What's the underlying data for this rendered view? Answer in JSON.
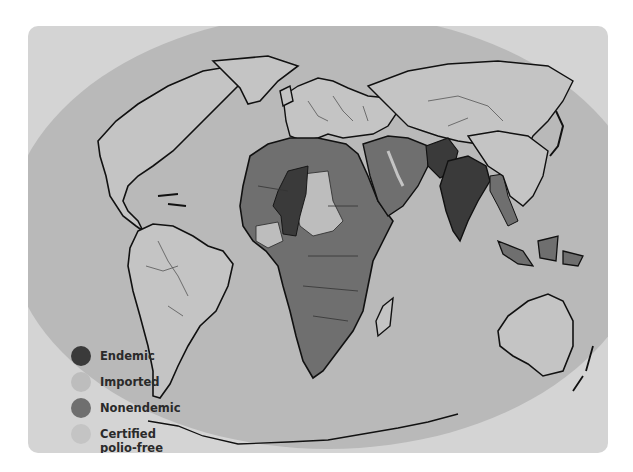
{
  "map": {
    "title": "Polio status world map",
    "colors": {
      "panel_background": "#d4d4d4",
      "globe_ocean": "#b9b9b9",
      "endemic": "#3a3a3a",
      "imported": "#bdbdbd",
      "nonendemic": "#6f6f6f",
      "certified_polio_free": "#c4c4c4",
      "coastline": "#111111",
      "border": "#444444"
    },
    "regions": [
      {
        "name": "Nigeria",
        "status": "Endemic"
      },
      {
        "name": "Niger",
        "status": "Endemic"
      },
      {
        "name": "India",
        "status": "Endemic"
      },
      {
        "name": "Pakistan",
        "status": "Endemic"
      },
      {
        "name": "Afghanistan",
        "status": "Endemic"
      },
      {
        "name": "Chad",
        "status": "Imported"
      },
      {
        "name": "Central African Republic",
        "status": "Imported"
      },
      {
        "name": "West Africa coastal states",
        "status": "Imported"
      },
      {
        "name": "North Africa",
        "status": "Nonendemic"
      },
      {
        "name": "Sub-Saharan Africa",
        "status": "Nonendemic"
      },
      {
        "name": "Middle East",
        "status": "Nonendemic"
      },
      {
        "name": "Southeast Asia (partial)",
        "status": "Nonendemic"
      },
      {
        "name": "Americas",
        "status": "Certified polio-free"
      },
      {
        "name": "Europe",
        "status": "Certified polio-free"
      },
      {
        "name": "East Asia & Pacific",
        "status": "Certified polio-free"
      }
    ]
  },
  "legend": {
    "items": [
      {
        "label": "Endemic",
        "color": "#3a3a3a"
      },
      {
        "label": "Imported",
        "color": "#bdbdbd"
      },
      {
        "label": "Nonendemic",
        "color": "#6f6f6f"
      },
      {
        "label": "Certified polio-free",
        "color": "#c4c4c4"
      }
    ]
  }
}
